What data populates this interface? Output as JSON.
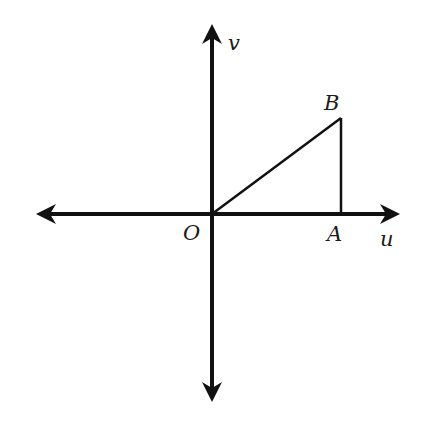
{
  "diagram": {
    "type": "coordinate-plane",
    "axes": {
      "horizontal_label": "u",
      "vertical_label": "v",
      "origin_label": "O"
    },
    "points": [
      {
        "name": "O",
        "label": "O"
      },
      {
        "name": "A",
        "label": "A"
      },
      {
        "name": "B",
        "label": "B"
      }
    ],
    "segments": [
      "OB",
      "BA"
    ],
    "colors": {
      "stroke": "#111111",
      "background": "#ffffff"
    }
  }
}
